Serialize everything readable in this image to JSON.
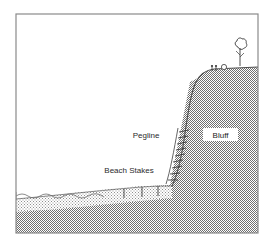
{
  "figure": {
    "type": "cross-section-diagram",
    "width": 274,
    "height": 251,
    "background_color": "#ffffff",
    "border_color": "#8a8a8a"
  },
  "labels": {
    "pegline": "Pegline",
    "beach_stakes": "Beach Stakes",
    "bluff": "Bluff"
  },
  "colors": {
    "bluff_fill": "#9a9a9a",
    "beach_fill": "#c9c9c9",
    "seabed_fill": "#9a9a9a",
    "line_color": "#555555",
    "water_line": "#6e6e6e",
    "label_box_fill": "#ffffff",
    "text_color": "#2b2b2b"
  },
  "features": {
    "water_label": "sea-water-surface",
    "wave_count": 5,
    "stake_count": 3,
    "pegline_tick_count": 9,
    "figure_count": 2,
    "tree_count": 1,
    "bush_count": 1
  }
}
